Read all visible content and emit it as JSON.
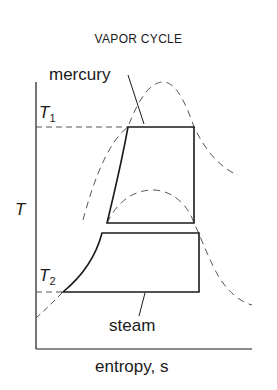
{
  "title": "VAPOR CYCLE",
  "labels": {
    "mercury": "mercury",
    "steam": "steam",
    "t1_main": "T",
    "t1_sub": "1",
    "t2_main": "T",
    "t2_sub": "2",
    "y_axis": "T",
    "x_axis": "entropy, s"
  },
  "colors": {
    "line": "#1a1a1a",
    "dashed": "#555555"
  }
}
